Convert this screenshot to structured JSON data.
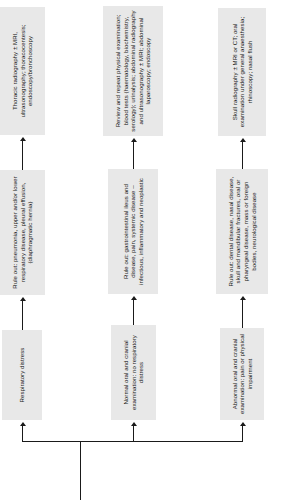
{
  "diagram": {
    "type": "flowchart",
    "orientation": "rotated-90-ccw",
    "colors": {
      "node_fill": "#e8e8e8",
      "text": "#1a1a1a",
      "connector": "#1a1a1a",
      "background": "#ffffff"
    },
    "branches": [
      {
        "id": "respiratory",
        "steps": [
          "Respiratory distress",
          "Rule out: pneumonia, upper and/or lower respiratory disease, pleural effusion, (diaphragmatic hernia)",
          "Thoracic radiography ± MRI, ultrasonography; thoracocentesis; endoscopy/bronchoscopy"
        ]
      },
      {
        "id": "normal-oral-cranial",
        "steps": [
          "Normal oral and cranial examination: no respiratory distress",
          "Rule out: gastrointestinal ileus and disease, pain, systemic disease – infectious, inflammatory and neoplastic",
          "Review and repeat physical examination; blood tests (haematology, biochemistry, serology); urinalysis; abdominal radiography and ultrasonography ± MRI; abdominal laparoscopy; endoscopy"
        ]
      },
      {
        "id": "abnormal-oral-cranial",
        "steps": [
          "Abnormal oral and cranial examination: pain or physical impairment",
          "Rule out: dental disease, nasal disease, skull and mandibular fractures, oral or pharyngeal disease, mass or foreign bodies, neurological disease",
          "Skull radiography ± MRI or CT; oral examination under general anaesthesia; rhinoscopy; nasal flush"
        ]
      }
    ]
  }
}
